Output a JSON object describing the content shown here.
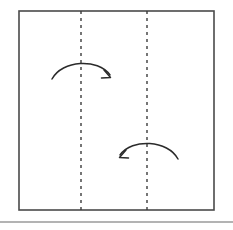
{
  "figure": {
    "background_color": "#ffffff",
    "width": 233,
    "height": 230
  },
  "sheet": {
    "name": "paper-sheet",
    "label": "Sheet of paper",
    "x": 19,
    "y": 11,
    "width": 195,
    "height": 199,
    "stroke_color": "#4a4a4a",
    "stroke_width": 1.6,
    "fill_color": "#ffffff"
  },
  "fold_lines": [
    {
      "name": "fold-line-left",
      "label": "Left fold crease",
      "x": 81,
      "y_start": 11,
      "y_end": 210,
      "stroke_color": "#3c3c3c",
      "stroke_width": 1.4,
      "dash_pattern": "3 4"
    },
    {
      "name": "fold-line-right",
      "label": "Right fold crease",
      "x": 147,
      "y_start": 11,
      "y_end": 210,
      "stroke_color": "#3c3c3c",
      "stroke_width": 1.4,
      "dash_pattern": "3 4"
    }
  ],
  "arrows": [
    {
      "name": "fold-arrow-top",
      "label": "Fold left panel to the right",
      "direction": "right",
      "path": "M 52 79 C 62 60, 98 58, 110 75",
      "head_path": "M 104 70 L 110.5 77.5 L 101.5 78",
      "stroke_color": "#2b2b2b",
      "stroke_width": 1.5
    },
    {
      "name": "fold-arrow-bottom",
      "label": "Fold right panel to the left",
      "direction": "left",
      "path": "M 178 159 C 168 140, 132 138, 120 155",
      "head_path": "M 126 150 L 119.5 157.5 L 128.5 158",
      "stroke_color": "#2b2b2b",
      "stroke_width": 1.5
    }
  ],
  "footer_rule": {
    "name": "footer-divider",
    "label": "Horizontal divider rule",
    "x_start": 0,
    "x_end": 233,
    "y": 222,
    "stroke_color": "#9a9a9a",
    "stroke_width": 1.4
  }
}
